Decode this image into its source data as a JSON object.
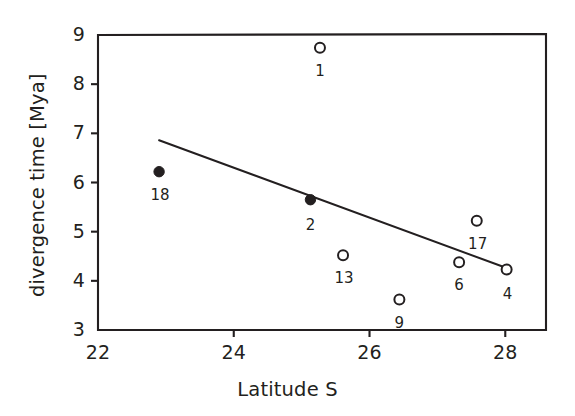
{
  "figure": {
    "background_color": "#ffffff",
    "ink_color": "#231f20"
  },
  "chart_data": {
    "type": "scatter",
    "title": "",
    "xlabel": "Latitude S",
    "ylabel": "divergence time [Mya]",
    "xlim": [
      22,
      28.6
    ],
    "ylim": [
      3,
      9
    ],
    "xticks": [
      22,
      24,
      26,
      28
    ],
    "yticks": [
      3,
      4,
      5,
      6,
      7,
      8,
      9
    ],
    "xtick_labels": [
      "22",
      "24",
      "26",
      "28"
    ],
    "ytick_labels": [
      "3",
      "4",
      "5",
      "6",
      "7",
      "8",
      "9"
    ],
    "grid": false,
    "legend": null,
    "points": [
      {
        "label": "1",
        "x": 25.27,
        "y": 8.74,
        "filled": false,
        "label_dx": 0,
        "label_dy": 16
      },
      {
        "label": "18",
        "x": 22.9,
        "y": 6.22,
        "filled": true,
        "label_dx": 1,
        "label_dy": 16
      },
      {
        "label": "2",
        "x": 25.13,
        "y": 5.65,
        "filled": true,
        "label_dx": 0,
        "label_dy": 18
      },
      {
        "label": "17",
        "x": 27.58,
        "y": 5.22,
        "filled": false,
        "label_dx": 1,
        "label_dy": 16
      },
      {
        "label": "13",
        "x": 25.61,
        "y": 4.52,
        "filled": false,
        "label_dx": 1,
        "label_dy": 16
      },
      {
        "label": "6",
        "x": 27.32,
        "y": 4.38,
        "filled": false,
        "label_dx": 0,
        "label_dy": 16
      },
      {
        "label": "4",
        "x": 28.02,
        "y": 4.23,
        "filled": false,
        "label_dx": 1,
        "label_dy": 17
      },
      {
        "label": "9",
        "x": 26.44,
        "y": 3.62,
        "filled": false,
        "label_dx": 0,
        "label_dy": 16
      }
    ],
    "trendline": {
      "name": "regression line",
      "x_start": 22.9,
      "y_start": 6.86,
      "x_end": 28.02,
      "y_end": 4.26
    },
    "marker": {
      "open_fill": "#ffffff",
      "edge_color": "#231f20",
      "radius_px": 5.0,
      "filled_radius_px": 5.2
    }
  }
}
